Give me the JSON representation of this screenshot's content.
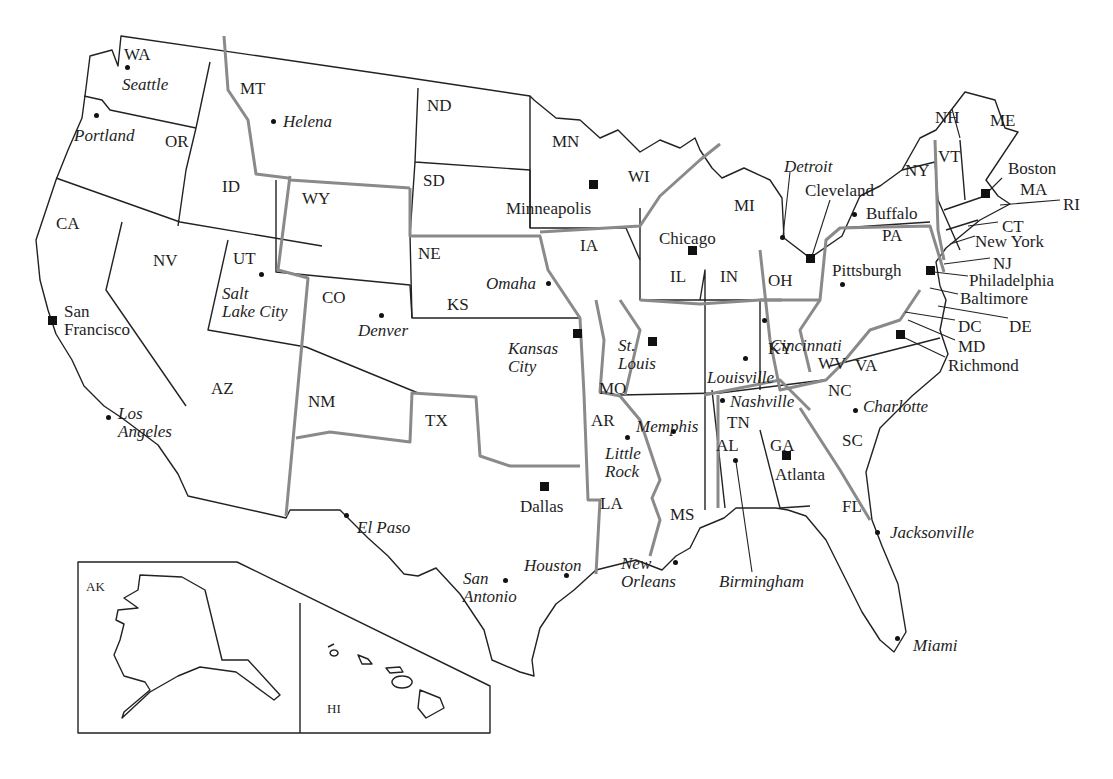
{
  "map": {
    "title": "United States regional map",
    "colors": {
      "state_border": "#222222",
      "region_border": "#8a8a8a",
      "background": "#ffffff",
      "text": "#1e1e1e"
    },
    "states": [
      {
        "abbr": "WA",
        "x": 124,
        "y": 46
      },
      {
        "abbr": "OR",
        "x": 165,
        "y": 133
      },
      {
        "abbr": "CA",
        "x": 56,
        "y": 215
      },
      {
        "abbr": "ID",
        "x": 222,
        "y": 178
      },
      {
        "abbr": "MT",
        "x": 240,
        "y": 80
      },
      {
        "abbr": "WY",
        "x": 302,
        "y": 190
      },
      {
        "abbr": "NV",
        "x": 153,
        "y": 252
      },
      {
        "abbr": "UT",
        "x": 233,
        "y": 250
      },
      {
        "abbr": "CO",
        "x": 322,
        "y": 289
      },
      {
        "abbr": "AZ",
        "x": 211,
        "y": 380
      },
      {
        "abbr": "NM",
        "x": 308,
        "y": 393
      },
      {
        "abbr": "TX",
        "x": 425,
        "y": 412
      },
      {
        "abbr": "ND",
        "x": 427,
        "y": 97
      },
      {
        "abbr": "SD",
        "x": 423,
        "y": 172
      },
      {
        "abbr": "NE",
        "x": 418,
        "y": 245
      },
      {
        "abbr": "KS",
        "x": 447,
        "y": 296
      },
      {
        "abbr": "MN",
        "x": 552,
        "y": 133
      },
      {
        "abbr": "IA",
        "x": 580,
        "y": 237
      },
      {
        "abbr": "MO",
        "x": 599,
        "y": 380
      },
      {
        "abbr": "AR",
        "x": 591,
        "y": 412
      },
      {
        "abbr": "LA",
        "x": 600,
        "y": 495
      },
      {
        "abbr": "WI",
        "x": 628,
        "y": 168
      },
      {
        "abbr": "IL",
        "x": 670,
        "y": 268
      },
      {
        "abbr": "MS",
        "x": 670,
        "y": 506
      },
      {
        "abbr": "MI",
        "x": 734,
        "y": 197
      },
      {
        "abbr": "IN",
        "x": 720,
        "y": 268
      },
      {
        "abbr": "OH",
        "x": 768,
        "y": 272
      },
      {
        "abbr": "KY",
        "x": 768,
        "y": 340
      },
      {
        "abbr": "TN",
        "x": 727,
        "y": 414
      },
      {
        "abbr": "AL",
        "x": 716,
        "y": 437
      },
      {
        "abbr": "GA",
        "x": 770,
        "y": 437
      },
      {
        "abbr": "WV",
        "x": 818,
        "y": 355
      },
      {
        "abbr": "VA",
        "x": 855,
        "y": 357
      },
      {
        "abbr": "NC",
        "x": 828,
        "y": 382
      },
      {
        "abbr": "SC",
        "x": 842,
        "y": 432
      },
      {
        "abbr": "FL",
        "x": 842,
        "y": 498
      },
      {
        "abbr": "PA",
        "x": 882,
        "y": 227
      },
      {
        "abbr": "NY",
        "x": 905,
        "y": 162
      },
      {
        "abbr": "VT",
        "x": 938,
        "y": 148
      },
      {
        "abbr": "NH",
        "x": 935,
        "y": 109
      },
      {
        "abbr": "ME",
        "x": 990,
        "y": 112
      },
      {
        "abbr": "MA",
        "x": 1020,
        "y": 181
      },
      {
        "abbr": "RI",
        "x": 1063,
        "y": 196
      },
      {
        "abbr": "CT",
        "x": 1002,
        "y": 218
      },
      {
        "abbr": "NJ",
        "x": 993,
        "y": 255
      },
      {
        "abbr": "DE",
        "x": 1009,
        "y": 318
      },
      {
        "abbr": "MD",
        "x": 958,
        "y": 338
      },
      {
        "abbr": "DC",
        "x": 958,
        "y": 318
      },
      {
        "abbr": "AK",
        "x": 86,
        "y": 580,
        "small": true
      },
      {
        "abbr": "HI",
        "x": 327,
        "y": 702,
        "small": true
      }
    ],
    "cities": [
      {
        "name": "Seattle",
        "x": 122,
        "y": 76,
        "italic": true,
        "marker": "dot",
        "mx": 127,
        "my": 67
      },
      {
        "name": "Portland",
        "x": 74,
        "y": 127,
        "italic": true,
        "marker": "dot",
        "mx": 96,
        "my": 115
      },
      {
        "name": "Helena",
        "x": 283,
        "y": 113,
        "italic": true,
        "marker": "dot",
        "mx": 273,
        "my": 121
      },
      {
        "name": "San\nFrancisco",
        "x": 64,
        "y": 303,
        "italic": false,
        "marker": "square",
        "mx": 52,
        "my": 320
      },
      {
        "name": "Los\nAngeles",
        "x": 118,
        "y": 405,
        "italic": true,
        "marker": "dot",
        "mx": 108,
        "my": 417
      },
      {
        "name": "Salt\nLake City",
        "x": 222,
        "y": 285,
        "italic": true,
        "marker": "dot",
        "mx": 261,
        "my": 274
      },
      {
        "name": "Denver",
        "x": 358,
        "y": 322,
        "italic": true,
        "marker": "dot",
        "mx": 381,
        "my": 315
      },
      {
        "name": "El Paso",
        "x": 357,
        "y": 519,
        "italic": true,
        "marker": "dot",
        "mx": 346,
        "my": 515
      },
      {
        "name": "Minneapolis",
        "x": 506,
        "y": 200,
        "italic": false,
        "marker": "square",
        "mx": 593,
        "my": 184
      },
      {
        "name": "Omaha",
        "x": 486,
        "y": 275,
        "italic": true,
        "marker": "dot",
        "mx": 548,
        "my": 283
      },
      {
        "name": "Kansas\nCity",
        "x": 508,
        "y": 340,
        "italic": true,
        "marker": "square",
        "mx": 577,
        "my": 333
      },
      {
        "name": "St.\nLouis",
        "x": 618,
        "y": 337,
        "italic": true,
        "marker": "square",
        "mx": 652,
        "my": 341
      },
      {
        "name": "Dallas",
        "x": 520,
        "y": 498,
        "italic": false,
        "marker": "square",
        "mx": 544,
        "my": 486
      },
      {
        "name": "Houston",
        "x": 524,
        "y": 557,
        "italic": true,
        "marker": "dot",
        "mx": 566,
        "my": 575
      },
      {
        "name": "San\nAntonio",
        "x": 463,
        "y": 570,
        "italic": true,
        "marker": "dot",
        "mx": 505,
        "my": 580
      },
      {
        "name": "Chicago",
        "x": 659,
        "y": 230,
        "italic": false,
        "marker": "square",
        "mx": 692,
        "my": 250
      },
      {
        "name": "Little\nRock",
        "x": 605,
        "y": 445,
        "italic": true,
        "marker": "dot",
        "mx": 627,
        "my": 437
      },
      {
        "name": "Memphis",
        "x": 636,
        "y": 418,
        "italic": true,
        "marker": "dot",
        "mx": 673,
        "my": 431
      },
      {
        "name": "New\nOrleans",
        "x": 621,
        "y": 555,
        "italic": true,
        "marker": "dot",
        "mx": 675,
        "my": 562
      },
      {
        "name": "Louisville",
        "x": 707,
        "y": 369,
        "italic": true,
        "marker": "dot",
        "mx": 745,
        "my": 358
      },
      {
        "name": "Nashville",
        "x": 730,
        "y": 393,
        "italic": true,
        "marker": "dot",
        "mx": 722,
        "my": 400
      },
      {
        "name": "Birmingham",
        "x": 719,
        "y": 573,
        "italic": true,
        "marker": "dot",
        "mx": 735,
        "my": 460
      },
      {
        "name": "Atlanta",
        "x": 775,
        "y": 466,
        "italic": false,
        "marker": "square",
        "mx": 786,
        "my": 455
      },
      {
        "name": "Detroit",
        "x": 784,
        "y": 158,
        "italic": true,
        "marker": "dot",
        "mx": 782,
        "my": 237
      },
      {
        "name": "Cleveland",
        "x": 805,
        "y": 182,
        "italic": false,
        "marker": "square",
        "mx": 810,
        "my": 258
      },
      {
        "name": "Buffalo",
        "x": 866,
        "y": 205,
        "italic": false,
        "marker": "dot",
        "mx": 854,
        "my": 214
      },
      {
        "name": "Cincinnati",
        "x": 770,
        "y": 337,
        "italic": true,
        "marker": "dot",
        "mx": 764,
        "my": 320
      },
      {
        "name": "Pittsburgh",
        "x": 832,
        "y": 262,
        "italic": false,
        "marker": "dot",
        "mx": 842,
        "my": 284
      },
      {
        "name": "Charlotte",
        "x": 863,
        "y": 398,
        "italic": true,
        "marker": "dot",
        "mx": 855,
        "my": 410
      },
      {
        "name": "Jacksonville",
        "x": 890,
        "y": 524,
        "italic": true,
        "marker": "dot",
        "mx": 877,
        "my": 532
      },
      {
        "name": "Miami",
        "x": 913,
        "y": 637,
        "italic": true,
        "marker": "dot",
        "mx": 897,
        "my": 638
      },
      {
        "name": "Boston",
        "x": 1008,
        "y": 160,
        "italic": false,
        "marker": "square",
        "mx": 985,
        "my": 193
      },
      {
        "name": "New York",
        "x": 975,
        "y": 233,
        "italic": false,
        "marker": "none",
        "mx": 0,
        "my": 0
      },
      {
        "name": "Philadelphia",
        "x": 969,
        "y": 272,
        "italic": false,
        "marker": "square",
        "mx": 930,
        "my": 270
      },
      {
        "name": "Baltimore",
        "x": 960,
        "y": 290,
        "italic": false,
        "marker": "none",
        "mx": 0,
        "my": 0
      },
      {
        "name": "Richmond",
        "x": 948,
        "y": 357,
        "italic": false,
        "marker": "square",
        "mx": 900,
        "my": 334
      }
    ]
  }
}
